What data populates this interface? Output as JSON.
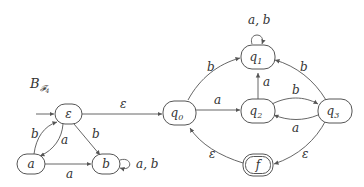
{
  "diagram": {
    "title_main": "B",
    "title_sub": "𝓕",
    "title_sub_index": "4",
    "nodes": {
      "eps": {
        "label": "ε"
      },
      "a": {
        "label": "a"
      },
      "b": {
        "label": "b"
      },
      "q0": {
        "label": "q",
        "sub": "0"
      },
      "q1": {
        "label": "q",
        "sub": "1"
      },
      "q2": {
        "label": "q",
        "sub": "2"
      },
      "q3": {
        "label": "q",
        "sub": "3"
      },
      "f": {
        "label": "f",
        "accepting": true
      }
    },
    "edges": {
      "a_to_eps": "b",
      "eps_to_a": "a",
      "eps_to_b": "b",
      "a_to_b": "a",
      "b_loop": "a, b",
      "eps_to_q0": "ε",
      "q0_to_q1": "b",
      "q0_to_q2": "a",
      "q1_loop": "a, b",
      "q2_to_q1": "a",
      "q2_to_q3": "b",
      "q3_to_q2": "a",
      "q3_to_q1": "b",
      "q3_to_f": "ε",
      "f_to_q0": "ε"
    },
    "start_node": "eps",
    "stroke_color": "#555555"
  }
}
